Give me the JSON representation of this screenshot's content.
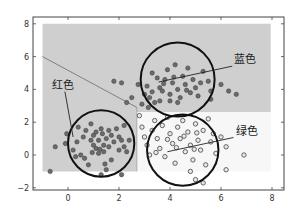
{
  "chart_data": {
    "type": "scatter",
    "title": "",
    "xlabel": "",
    "ylabel": "",
    "xlim": [
      -1.4,
      8.5
    ],
    "ylim": [
      -2.1,
      8.2
    ],
    "x_ticks": [
      "0",
      "2",
      "4",
      "6",
      "8"
    ],
    "y_ticks": [
      "8",
      "6",
      "4",
      "2",
      "0",
      "−2"
    ],
    "grid": false,
    "legend": null,
    "colors": {
      "background": "#ffffff",
      "region_gray": "#cfcfcf",
      "region_white": "#f7f7f7",
      "point_fill": "#6b6b6b",
      "point_edge": "#3a3a3a",
      "circle": "#111111",
      "boundary": "#808080",
      "axis": "#444444"
    },
    "regions": [
      {
        "name": "gray-region",
        "class": "红色/蓝色",
        "polygon": [
          [
            -1,
            8
          ],
          [
            7.95,
            8
          ],
          [
            7.95,
            2.6
          ],
          [
            2.7,
            2.6
          ],
          [
            2.7,
            -1
          ],
          [
            -1,
            -1
          ]
        ]
      },
      {
        "name": "white-region",
        "class": "绿色",
        "polygon": [
          [
            2.7,
            2.6
          ],
          [
            7.95,
            2.6
          ],
          [
            7.95,
            -1
          ],
          [
            2.7,
            -1
          ]
        ]
      }
    ],
    "boundary_line": [
      [
        -1,
        6
      ],
      [
        2.7,
        2.9
      ]
    ],
    "circles": [
      {
        "name": "red-cluster-circle",
        "label": "红色",
        "cx": 1.3,
        "cy": 0.7,
        "r": 1.3
      },
      {
        "name": "blue-cluster-circle",
        "label": "蓝色",
        "cx": 4.3,
        "cy": 4.6,
        "r": 1.45
      },
      {
        "name": "green-cluster-circle",
        "label": "绿色",
        "cx": 4.5,
        "cy": 0.3,
        "r": 1.4
      }
    ],
    "annotations": [
      {
        "text": "红色",
        "x": -0.2,
        "y": 4.05,
        "arrow_to": [
          0.2,
          1.1
        ]
      },
      {
        "text": "蓝色",
        "x": 6.95,
        "y": 5.6,
        "arrow_to": [
          3.55,
          4.45
        ]
      },
      {
        "text": "绿色",
        "x": 7.0,
        "y": 1.25,
        "arrow_to": [
          3.9,
          0.2
        ]
      }
    ],
    "series": [
      {
        "name": "红色",
        "marker": "filled-circle",
        "points": [
          [
            -0.7,
            -1.0
          ],
          [
            -0.5,
            0.5
          ],
          [
            -0.05,
            1.3
          ],
          [
            -0.1,
            0.7
          ],
          [
            0.2,
            0.3
          ],
          [
            0.35,
            0.8
          ],
          [
            0.6,
            1.1
          ],
          [
            0.5,
            0.0
          ],
          [
            0.7,
            1.5
          ],
          [
            0.9,
            1.9
          ],
          [
            1.0,
            1.2
          ],
          [
            1.2,
            0.9
          ],
          [
            1.1,
            0.4
          ],
          [
            1.3,
            1.6
          ],
          [
            1.4,
            0.2
          ],
          [
            1.5,
            1.0
          ],
          [
            1.6,
            0.5
          ],
          [
            1.7,
            1.2
          ],
          [
            1.2,
            0.1
          ],
          [
            1.0,
            0.6
          ],
          [
            0.9,
            0.9
          ],
          [
            1.4,
            0.6
          ],
          [
            1.8,
            0.8
          ],
          [
            2.0,
            0.3
          ],
          [
            2.1,
            0.9
          ],
          [
            2.3,
            0.2
          ],
          [
            2.4,
            0.9
          ],
          [
            1.5,
            -0.9
          ],
          [
            1.3,
            -1.2
          ],
          [
            2.1,
            -1.2
          ],
          [
            0.8,
            -0.6
          ],
          [
            1.9,
            1.6
          ],
          [
            2.2,
            1.8
          ],
          [
            0.4,
            1.7
          ],
          [
            1.1,
            1.4
          ],
          [
            1.35,
            1.3
          ],
          [
            1.6,
            1.5
          ],
          [
            0.65,
            -0.2
          ],
          [
            2.0,
            1.1
          ],
          [
            1.7,
            -0.3
          ],
          [
            1.25,
            0.35
          ],
          [
            1.45,
            -0.55
          ],
          [
            0.3,
            -0.1
          ],
          [
            2.2,
            0.5
          ],
          [
            0.95,
            0.15
          ]
        ]
      },
      {
        "name": "蓝色",
        "marker": "filled-circle",
        "points": [
          [
            2.3,
            3.2
          ],
          [
            2.75,
            4.3
          ],
          [
            3.0,
            3.7
          ],
          [
            3.1,
            4.2
          ],
          [
            3.2,
            3.5
          ],
          [
            3.3,
            5.0
          ],
          [
            3.5,
            4.7
          ],
          [
            3.6,
            4.1
          ],
          [
            3.7,
            3.9
          ],
          [
            3.8,
            4.6
          ],
          [
            3.9,
            5.2
          ],
          [
            4.0,
            3.7
          ],
          [
            4.1,
            4.4
          ],
          [
            4.2,
            5.5
          ],
          [
            4.3,
            4.0
          ],
          [
            4.4,
            3.5
          ],
          [
            4.5,
            4.8
          ],
          [
            4.6,
            4.3
          ],
          [
            4.7,
            5.3
          ],
          [
            4.8,
            3.8
          ],
          [
            4.9,
            4.6
          ],
          [
            5.0,
            4.1
          ],
          [
            5.1,
            3.6
          ],
          [
            5.2,
            4.4
          ],
          [
            3.4,
            3.2
          ],
          [
            3.6,
            3.3
          ],
          [
            4.0,
            3.3
          ],
          [
            4.3,
            3.2
          ],
          [
            5.5,
            4.5
          ],
          [
            5.6,
            3.9
          ],
          [
            6.0,
            4.3
          ],
          [
            6.3,
            3.9
          ],
          [
            6.6,
            3.7
          ],
          [
            3.15,
            2.9
          ],
          [
            2.9,
            3.1
          ],
          [
            5.3,
            5.1
          ],
          [
            4.15,
            4.75
          ],
          [
            3.75,
            4.35
          ],
          [
            4.65,
            3.95
          ],
          [
            3.3,
            3.85
          ],
          [
            5.6,
            3.4
          ],
          [
            2.5,
            3.5
          ],
          [
            2.1,
            4.4
          ],
          [
            1.8,
            4.5
          ]
        ]
      },
      {
        "name": "绿色",
        "marker": "open-circle",
        "points": [
          [
            2.8,
            2.4
          ],
          [
            2.9,
            1.7
          ],
          [
            3.0,
            1.1
          ],
          [
            3.1,
            0.6
          ],
          [
            3.2,
            0.0
          ],
          [
            3.3,
            1.5
          ],
          [
            3.4,
            2.1
          ],
          [
            3.5,
            1.0
          ],
          [
            3.6,
            0.4
          ],
          [
            3.7,
            1.8
          ],
          [
            3.8,
            -0.1
          ],
          [
            3.9,
            2.3
          ],
          [
            4.0,
            1.3
          ],
          [
            4.1,
            0.7
          ],
          [
            4.2,
            -0.5
          ],
          [
            4.3,
            1.7
          ],
          [
            4.4,
            1.0
          ],
          [
            4.5,
            2.1
          ],
          [
            4.6,
            0.2
          ],
          [
            4.7,
            1.4
          ],
          [
            4.8,
            0.6
          ],
          [
            4.9,
            -0.3
          ],
          [
            5.0,
            1.9
          ],
          [
            5.1,
            0.9
          ],
          [
            5.2,
            0.3
          ],
          [
            5.3,
            1.5
          ],
          [
            5.4,
            -0.6
          ],
          [
            5.5,
            2.2
          ],
          [
            5.6,
            0.8
          ],
          [
            5.7,
            1.3
          ],
          [
            5.8,
            0.1
          ],
          [
            6.0,
            1.1
          ],
          [
            6.2,
            0.5
          ],
          [
            6.9,
            0.0
          ],
          [
            6.2,
            -0.9
          ],
          [
            5.0,
            -1.5
          ],
          [
            5.3,
            -1.7
          ],
          [
            4.8,
            -1.0
          ],
          [
            4.55,
            1.15
          ],
          [
            4.25,
            0.45
          ],
          [
            3.45,
            0.15
          ],
          [
            5.05,
            1.35
          ],
          [
            4.95,
            0.35
          ],
          [
            3.9,
            0.95
          ]
        ]
      }
    ]
  }
}
